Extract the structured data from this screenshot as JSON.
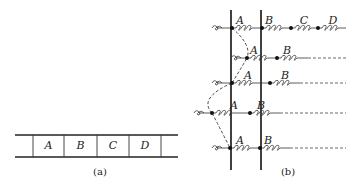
{
  "figure_a": {
    "caption": "(a)",
    "cells": [
      "A",
      "B",
      "C",
      "D"
    ],
    "strip": {
      "x0": 15,
      "x1": 178,
      "top": 135,
      "bottom": 157
    },
    "dividers": [
      33,
      64,
      97,
      129,
      161
    ],
    "cell_label_y": 149
  },
  "figure_b": {
    "caption": "(b)",
    "verticals": [
      231,
      261
    ],
    "vertical_span": [
      10,
      170
    ],
    "rows": [
      {
        "y": 28,
        "start": 218,
        "dot_x": [
          232,
          262,
          291,
          318
        ],
        "labels": [
          {
            "t": "A",
            "x": 240
          },
          {
            "t": "B",
            "x": 269
          },
          {
            "t": "C",
            "x": 304
          },
          {
            "t": "D",
            "x": 333
          }
        ],
        "solid_to": 346,
        "dash_to": null
      },
      {
        "y": 58,
        "start": 237,
        "dot_x": [
          247,
          277
        ],
        "labels": [
          {
            "t": "A",
            "x": 254
          },
          {
            "t": "B",
            "x": 287
          }
        ],
        "solid_to": 308,
        "dash_to": 346
      },
      {
        "y": 83,
        "start": 218,
        "dot_x": [
          232,
          270
        ],
        "labels": [
          {
            "t": "A",
            "x": 248
          },
          {
            "t": "B",
            "x": 285
          }
        ],
        "solid_to": 300,
        "dash_to": 346
      },
      {
        "y": 113,
        "start": 200,
        "dot_x": [
          212,
          250
        ],
        "labels": [
          {
            "t": "A",
            "x": 234
          },
          {
            "t": "B",
            "x": 261
          }
        ],
        "solid_to": 280,
        "dash_to": 346
      },
      {
        "y": 148,
        "start": 218,
        "dot_x": [
          230,
          260
        ],
        "labels": [
          {
            "t": "A",
            "x": 240
          },
          {
            "t": "B",
            "x": 268
          }
        ],
        "solid_to": 290,
        "dash_to": 346
      }
    ]
  }
}
